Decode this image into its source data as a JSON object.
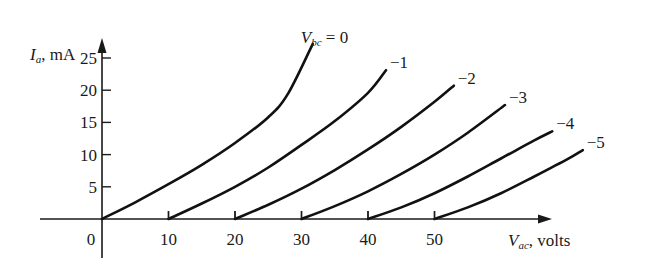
{
  "chart_data": {
    "type": "line",
    "title": "",
    "xlabel": "V_ac, volts",
    "ylabel": "I_a, mA",
    "xlabel_parts": {
      "main": "V",
      "sub": "ac",
      "rest": ", volts"
    },
    "ylabel_parts": {
      "main": "I",
      "sub": "a",
      "rest": ", mA"
    },
    "x_ticks": [
      0,
      10,
      20,
      30,
      40,
      50
    ],
    "y_ticks": [
      5,
      10,
      15,
      20,
      25
    ],
    "xlim": [
      -12,
      68
    ],
    "ylim": [
      -6,
      30
    ],
    "grid": false,
    "legend": "inline labels at curve ends",
    "series_label_prefix": {
      "main": "V",
      "sub": "bc",
      "rest": " = "
    },
    "series": [
      {
        "name": "V_bc = 0",
        "label": "0",
        "points": [
          [
            0,
            0
          ],
          [
            5,
            2.6
          ],
          [
            10,
            5.4
          ],
          [
            15,
            8.4
          ],
          [
            20,
            11.8
          ],
          [
            25,
            15.8
          ],
          [
            28,
            19.5
          ],
          [
            31.7,
            27.2
          ]
        ]
      },
      {
        "name": "V_bc = -1",
        "label": "−1",
        "points": [
          [
            10,
            0
          ],
          [
            15,
            2.4
          ],
          [
            20,
            5.0
          ],
          [
            25,
            8.0
          ],
          [
            30,
            11.5
          ],
          [
            35,
            15.2
          ],
          [
            40,
            19.6
          ],
          [
            42.7,
            23.1
          ]
        ]
      },
      {
        "name": "V_bc = -2",
        "label": "−2",
        "points": [
          [
            20,
            0
          ],
          [
            25,
            2.2
          ],
          [
            30,
            4.7
          ],
          [
            35,
            7.6
          ],
          [
            40,
            10.8
          ],
          [
            45,
            14.3
          ],
          [
            50,
            18.2
          ],
          [
            52.9,
            20.7
          ]
        ]
      },
      {
        "name": "V_bc = -3",
        "label": "−3",
        "points": [
          [
            30,
            0
          ],
          [
            35,
            2.0
          ],
          [
            40,
            4.3
          ],
          [
            45,
            7.0
          ],
          [
            50,
            10.0
          ],
          [
            55,
            13.4
          ],
          [
            60.6,
            17.7
          ]
        ]
      },
      {
        "name": "V_bc = -4",
        "label": "−4",
        "points": [
          [
            40,
            0
          ],
          [
            45,
            1.8
          ],
          [
            50,
            4.0
          ],
          [
            55,
            6.6
          ],
          [
            60,
            9.4
          ],
          [
            65,
            12.2
          ],
          [
            67.7,
            13.6
          ]
        ]
      },
      {
        "name": "V_bc = -5",
        "label": "−5",
        "points": [
          [
            50,
            0
          ],
          [
            55,
            1.8
          ],
          [
            60,
            4.0
          ],
          [
            65,
            6.6
          ],
          [
            70,
            9.3
          ],
          [
            72.3,
            10.7
          ]
        ]
      }
    ]
  },
  "style": {
    "line_color": "#111111",
    "axis_color": "#1a1a1a",
    "background": "#ffffff"
  }
}
